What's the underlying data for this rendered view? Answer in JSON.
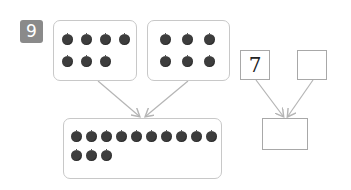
{
  "problem": {
    "number": "9",
    "badge_color": "#8a8a8a"
  },
  "left_diagram": {
    "group_a": {
      "apple_rows": [
        4,
        3
      ],
      "total": 7
    },
    "group_b": {
      "apple_rows": [
        3,
        3
      ],
      "total": 6
    },
    "combined": {
      "apple_rows": [
        10,
        3
      ],
      "total": 13
    }
  },
  "right_diagram": {
    "part_a": {
      "value": "7"
    },
    "part_b": {
      "value": ""
    },
    "whole": {
      "value": ""
    }
  },
  "colors": {
    "apple": "#3d3d3d",
    "box_border": "#c8c8c8",
    "arrow": "#b5b5b5"
  }
}
